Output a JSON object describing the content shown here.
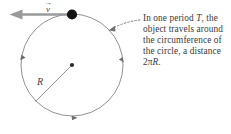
{
  "figure": {
    "background_color": "#ffffff",
    "stroke_color": "#7a7a7a",
    "ink_color": "#3a3a3a",
    "arrow_color": "#8a8a8a"
  },
  "velocity": {
    "symbol": "v",
    "vector_accent": "→",
    "direction": "left",
    "description": "velocity vector tangent to circle at top"
  },
  "radius": {
    "label": "R",
    "description": "radius line from center to lower-left of circle"
  },
  "circle": {
    "center_dot": "center-point",
    "object_dot": "orbiting-object",
    "motion_direction": "counterclockwise",
    "arrowhead_count": 3
  },
  "annotation": {
    "line1_pre": "In one period ",
    "line1_var": "T",
    "line1_post": ",",
    "line2": "the object travels",
    "line3": "around the",
    "line4": "circumference of",
    "line5": "the circle, a",
    "line6_pre": "distance 2",
    "line6_pi": "π",
    "line6_var": "R",
    "line6_post": ".",
    "full_text": "In one period T, the object travels around the circumference of the circle, a distance 2πR."
  }
}
